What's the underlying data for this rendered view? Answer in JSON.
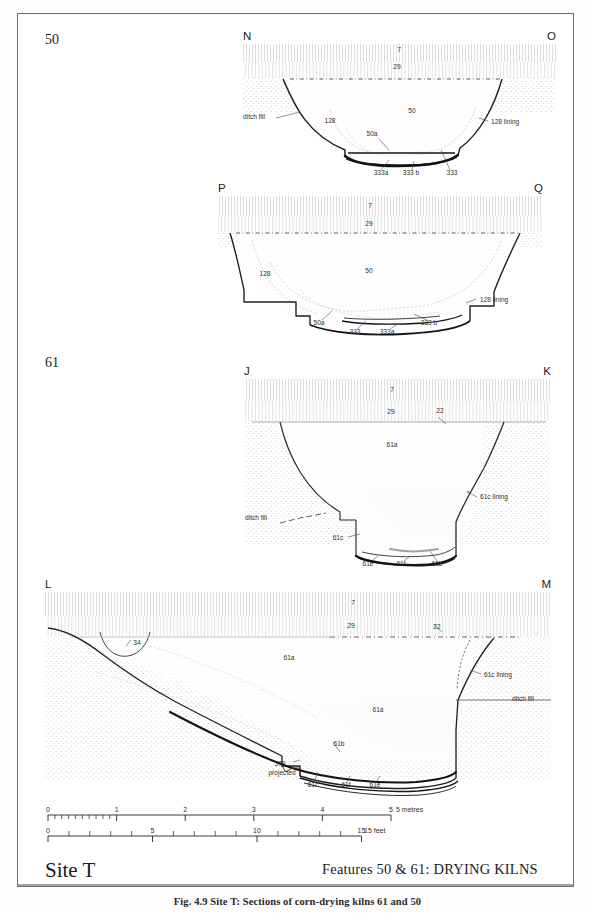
{
  "plate": {
    "site_label": "Site T",
    "features_title": "Features 50 & 61:  DRYING  KILNS",
    "caption": "Fig. 4.9 Site T: Sections of corn-drying kilns 61 and 50"
  },
  "row_labels": [
    {
      "id": "row-label-50",
      "text": "50",
      "x": 45,
      "y": 44
    },
    {
      "id": "row-label-61",
      "text": "61",
      "x": 45,
      "y": 367
    }
  ],
  "sections": [
    {
      "id": "section-no",
      "name": "section-n-o",
      "left_marker": "N",
      "right_marker": "O",
      "left_marker_pos": {
        "x": 243,
        "y": 40
      },
      "right_marker_pos": {
        "x": 556,
        "y": 40
      },
      "labels": [
        {
          "name": "context-7",
          "text": "7",
          "x": 399,
          "y": 52,
          "anchor": "middle"
        },
        {
          "name": "context-29",
          "text": "29",
          "x": 397,
          "y": 69,
          "anchor": "middle"
        },
        {
          "name": "context-50",
          "text": "50",
          "x": 412,
          "y": 113,
          "anchor": "middle"
        },
        {
          "name": "ditch-fill",
          "text": "ditch fill",
          "x": 243,
          "y": 119,
          "anchor": "start"
        },
        {
          "name": "context-128",
          "text": "128",
          "x": 330,
          "y": 123,
          "anchor": "middle"
        },
        {
          "name": "context-128-lining",
          "text": "128  lining",
          "x": 491,
          "y": 124,
          "anchor": "start"
        },
        {
          "name": "context-50a",
          "text": "50a",
          "x": 372,
          "y": 136,
          "anchor": "middle"
        },
        {
          "name": "context-333a",
          "text": "333a",
          "x": 381,
          "y": 175,
          "anchor": "middle"
        },
        {
          "name": "context-333b",
          "text": "333 b",
          "x": 411,
          "y": 175,
          "anchor": "middle"
        },
        {
          "name": "context-333",
          "text": "333",
          "x": 452,
          "y": 175,
          "anchor": "middle"
        }
      ]
    },
    {
      "id": "section-pq",
      "name": "section-p-q",
      "left_marker": "P",
      "right_marker": "Q",
      "left_marker_pos": {
        "x": 218,
        "y": 192
      },
      "right_marker_pos": {
        "x": 543,
        "y": 192
      },
      "labels": [
        {
          "name": "context-7",
          "text": "7",
          "x": 370,
          "y": 208,
          "anchor": "middle"
        },
        {
          "name": "context-29",
          "text": "29",
          "x": 369,
          "y": 226,
          "anchor": "middle"
        },
        {
          "name": "context-50",
          "text": "50",
          "x": 369,
          "y": 273,
          "anchor": "middle"
        },
        {
          "name": "context-128",
          "text": "128",
          "x": 265,
          "y": 276,
          "anchor": "middle"
        },
        {
          "name": "context-128-lining",
          "text": "128 lining",
          "x": 480,
          "y": 302,
          "anchor": "start"
        },
        {
          "name": "context-50a",
          "text": "50a",
          "x": 319,
          "y": 325,
          "anchor": "middle"
        },
        {
          "name": "context-333",
          "text": "333",
          "x": 355,
          "y": 334,
          "anchor": "middle"
        },
        {
          "name": "context-333a",
          "text": "333a",
          "x": 387,
          "y": 334,
          "anchor": "middle"
        },
        {
          "name": "context-333b",
          "text": "333 b",
          "x": 429,
          "y": 325,
          "anchor": "middle"
        }
      ]
    },
    {
      "id": "section-jk",
      "name": "section-j-k",
      "left_marker": "J",
      "right_marker": "K",
      "left_marker_pos": {
        "x": 244,
        "y": 375
      },
      "right_marker_pos": {
        "x": 551,
        "y": 375
      },
      "labels": [
        {
          "name": "context-7",
          "text": "7",
          "x": 392,
          "y": 392,
          "anchor": "middle"
        },
        {
          "name": "context-29",
          "text": "29",
          "x": 391,
          "y": 414,
          "anchor": "middle"
        },
        {
          "name": "context-22",
          "text": "22",
          "x": 440,
          "y": 413,
          "anchor": "middle"
        },
        {
          "name": "context-61a",
          "text": "61a",
          "x": 392,
          "y": 447,
          "anchor": "middle"
        },
        {
          "name": "context-61c-lining",
          "text": "61c  lining",
          "x": 480,
          "y": 499,
          "anchor": "start"
        },
        {
          "name": "ditch-fill",
          "text": "ditch fill",
          "x": 245,
          "y": 520,
          "anchor": "start"
        },
        {
          "name": "context-61c",
          "text": "61c",
          "x": 338,
          "y": 540,
          "anchor": "middle"
        },
        {
          "name": "context-61e",
          "text": "61e",
          "x": 368,
          "y": 566,
          "anchor": "middle"
        },
        {
          "name": "context-61f",
          "text": "61f",
          "x": 401,
          "y": 566,
          "anchor": "middle"
        },
        {
          "name": "context-61b",
          "text": "61b",
          "x": 437,
          "y": 566,
          "anchor": "middle"
        }
      ]
    },
    {
      "id": "section-lm",
      "name": "section-l-m",
      "left_marker": "L",
      "right_marker": "M",
      "left_marker_pos": {
        "x": 45,
        "y": 588
      },
      "right_marker_pos": {
        "x": 551,
        "y": 588
      },
      "labels": [
        {
          "name": "context-7",
          "text": "7",
          "x": 353,
          "y": 605,
          "anchor": "middle"
        },
        {
          "name": "context-29",
          "text": "29",
          "x": 351,
          "y": 628,
          "anchor": "middle"
        },
        {
          "name": "context-22",
          "text": "22",
          "x": 437,
          "y": 629,
          "anchor": "middle"
        },
        {
          "name": "context-34",
          "text": "34",
          "x": 137,
          "y": 645,
          "anchor": "middle"
        },
        {
          "name": "context-61a-upper",
          "text": "61a",
          "x": 289,
          "y": 660,
          "anchor": "middle"
        },
        {
          "name": "context-61c-lining",
          "text": "61c  lining",
          "x": 484,
          "y": 677,
          "anchor": "start"
        },
        {
          "name": "ditch-fill",
          "text": "ditch fill",
          "x": 512,
          "y": 701,
          "anchor": "start"
        },
        {
          "name": "context-61a-lower",
          "text": "61a",
          "x": 378,
          "y": 712,
          "anchor": "middle"
        },
        {
          "name": "context-61b",
          "text": "61b",
          "x": 339,
          "y": 746,
          "anchor": "middle"
        },
        {
          "name": "context-379",
          "text": "379",
          "x": 280,
          "y": 766,
          "anchor": "middle"
        },
        {
          "name": "context-379-projected",
          "text": "projected",
          "x": 282,
          "y": 775,
          "anchor": "middle"
        },
        {
          "name": "context-61c",
          "text": "61c",
          "x": 313,
          "y": 787,
          "anchor": "middle"
        },
        {
          "name": "context-61f",
          "text": "61f",
          "x": 346,
          "y": 787,
          "anchor": "middle"
        },
        {
          "name": "context-61e",
          "text": "61e",
          "x": 375,
          "y": 787,
          "anchor": "middle"
        }
      ]
    }
  ],
  "scales": [
    {
      "id": "metric-scale",
      "name": "scale-bar-metres",
      "unit_label": "5 metres",
      "unit_label_x": 396,
      "x0": 48,
      "y": 815,
      "px_per_unit": 68.6,
      "major_ticks": [
        {
          "value": 0,
          "label": "0"
        },
        {
          "value": 1,
          "label": "1"
        },
        {
          "value": 2,
          "label": "2"
        },
        {
          "value": 3,
          "label": "3"
        },
        {
          "value": 4,
          "label": "4"
        },
        {
          "value": 5,
          "label": "5"
        }
      ],
      "minor_divisions_first_unit": 10
    },
    {
      "id": "imperial-scale",
      "name": "scale-bar-feet",
      "unit_label": "15 feet",
      "unit_label_x": 364,
      "x0": 48,
      "y": 836,
      "px_per_unit": 20.9,
      "major_ticks": [
        {
          "value": 0,
          "label": "0"
        },
        {
          "value": 5,
          "label": "5"
        },
        {
          "value": 10,
          "label": "10"
        },
        {
          "value": 15,
          "label": "15"
        }
      ],
      "minor_divisions": 1,
      "minor_max": 15
    }
  ],
  "colors": {
    "ink": "#1a1a1a",
    "line": "#3b3b3b",
    "light_line": "#9a9a9a",
    "stipple": "#b8b8b8",
    "hatch": "#c9c9c9",
    "frame": "#6d6d6d",
    "paper": "#ffffff"
  }
}
